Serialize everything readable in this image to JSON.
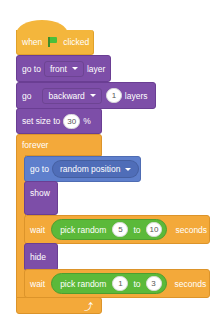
{
  "script": {
    "hat": {
      "when": "when",
      "clicked": "clicked",
      "icon": "green-flag-icon"
    },
    "go_to_layer": {
      "prefix": "go to",
      "dropdown": "front",
      "suffix": "layer"
    },
    "go_layers": {
      "prefix": "go",
      "dropdown": "backward",
      "value": "1",
      "suffix": "layers"
    },
    "set_size": {
      "prefix": "set size to",
      "value": "30",
      "suffix": "%"
    },
    "forever": {
      "label": "forever",
      "icon": "loop-arrow-icon"
    },
    "go_to_position": {
      "prefix": "go to",
      "dropdown": "random position"
    },
    "show": {
      "label": "show"
    },
    "wait1": {
      "prefix": "wait",
      "reporter": "pick random",
      "from": "5",
      "to_label": "to",
      "to": "10",
      "suffix": "seconds"
    },
    "hide": {
      "label": "hide"
    },
    "wait2": {
      "prefix": "wait",
      "reporter": "pick random",
      "from": "1",
      "to_label": "to",
      "to": "3",
      "suffix": "seconds"
    }
  },
  "colors": {
    "events": "#F4B63C",
    "looks": "#7D4EA8",
    "control": "#F3A93A",
    "motion": "#5E7FCC",
    "operators": "#5BB93A"
  }
}
